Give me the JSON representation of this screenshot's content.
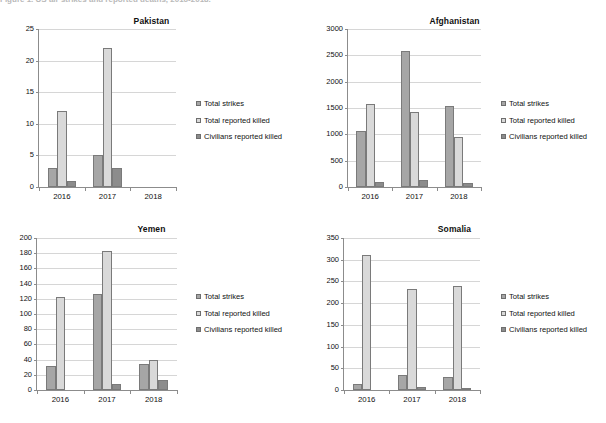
{
  "page": {
    "clipped_header": "Figure 1. US air strikes and reported deaths, 2016-2018."
  },
  "legend": {
    "items": [
      {
        "label": "Total strikes",
        "color": "#a6a6a6",
        "icon": "legend-swatch"
      },
      {
        "label": "Total reported killed",
        "color": "#d9d9d9",
        "icon": "legend-swatch"
      },
      {
        "label": "Civilians reported killed",
        "color": "#8c8c8c",
        "icon": "legend-swatch"
      }
    ]
  },
  "chart_data": [
    {
      "type": "bar",
      "title": "Pakistan",
      "categories": [
        "2016",
        "2017",
        "2018"
      ],
      "series": [
        {
          "name": "Total strikes",
          "values": [
            3,
            5,
            0
          ],
          "color": "#a6a6a6"
        },
        {
          "name": "Total reported killed",
          "values": [
            12,
            22,
            0
          ],
          "color": "#d9d9d9"
        },
        {
          "name": "Civilians reported killed",
          "values": [
            1,
            3,
            0
          ],
          "color": "#8c8c8c"
        }
      ],
      "xlabel": "",
      "ylabel": "",
      "ylim": [
        0,
        25
      ],
      "ystep": 5,
      "yticks": [
        0,
        5,
        10,
        15,
        20,
        25
      ],
      "grid": true,
      "legend_position": "right"
    },
    {
      "type": "bar",
      "title": "Afghanistan",
      "categories": [
        "2016",
        "2017",
        "2018"
      ],
      "series": [
        {
          "name": "Total strikes",
          "values": [
            1071,
            2586,
            1536
          ],
          "color": "#a6a6a6"
        },
        {
          "name": "Total reported killed",
          "values": [
            1581,
            1427,
            956
          ],
          "color": "#d9d9d9"
        },
        {
          "name": "Civilians reported killed",
          "values": [
            90,
            124,
            78
          ],
          "color": "#8c8c8c"
        }
      ],
      "xlabel": "",
      "ylabel": "",
      "ylim": [
        0,
        3000
      ],
      "ystep": 500,
      "yticks": [
        0,
        500,
        1000,
        1500,
        2000,
        2500,
        3000
      ],
      "grid": true,
      "legend_position": "right"
    },
    {
      "type": "bar",
      "title": "Yemen",
      "categories": [
        "2016",
        "2017",
        "2018"
      ],
      "series": [
        {
          "name": "Total strikes",
          "values": [
            31,
            126,
            34
          ],
          "color": "#a6a6a6"
        },
        {
          "name": "Total reported killed",
          "values": [
            122,
            183,
            40
          ],
          "color": "#d9d9d9"
        },
        {
          "name": "Civilians reported killed",
          "values": [
            0,
            8,
            13
          ],
          "color": "#8c8c8c"
        }
      ],
      "xlabel": "",
      "ylabel": "",
      "ylim": [
        0,
        200
      ],
      "ystep": 20,
      "yticks": [
        0,
        20,
        40,
        60,
        80,
        100,
        120,
        140,
        160,
        180,
        200
      ],
      "grid": true,
      "legend_position": "right"
    },
    {
      "type": "bar",
      "title": "Somalia",
      "categories": [
        "2016",
        "2017",
        "2018"
      ],
      "series": [
        {
          "name": "Total strikes",
          "values": [
            15,
            34,
            30
          ],
          "color": "#a6a6a6"
        },
        {
          "name": "Total reported killed",
          "values": [
            312,
            232,
            239
          ],
          "color": "#d9d9d9"
        },
        {
          "name": "Civilians reported killed",
          "values": [
            0,
            7,
            2
          ],
          "color": "#8c8c8c"
        }
      ],
      "xlabel": "",
      "ylabel": "",
      "ylim": [
        0,
        350
      ],
      "ystep": 50,
      "yticks": [
        0,
        50,
        100,
        150,
        200,
        250,
        300,
        350
      ],
      "grid": true,
      "legend_position": "right"
    }
  ]
}
